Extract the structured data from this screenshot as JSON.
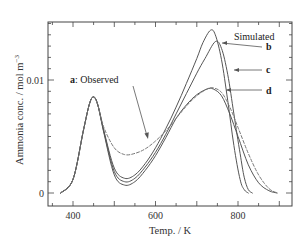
{
  "chart_data": {
    "type": "line",
    "title": "",
    "xlabel": "Temp. / K",
    "ylabel": "Ammonia conc. / mol m⁻³",
    "xlim": [
      340,
      932
    ],
    "ylim": [
      0,
      0.0151
    ],
    "x_ticks": [
      400,
      600,
      800
    ],
    "y_ticks": [
      0,
      0.01
    ],
    "x_tick_labels": [
      "400",
      "600",
      "800"
    ],
    "y_tick_labels": [
      "0",
      "0.01"
    ],
    "grid": false,
    "legend": "none (inline annotations)",
    "series": [
      {
        "name": "a: Observed",
        "style": "dashed",
        "x": [
          370,
          400,
          425,
          440,
          450,
          460,
          475,
          500,
          525,
          550,
          575,
          600,
          625,
          650,
          675,
          700,
          725,
          740,
          760,
          780,
          800,
          825,
          850,
          875,
          895
        ],
        "y": [
          0.0,
          0.0012,
          0.0055,
          0.0079,
          0.0085,
          0.0078,
          0.0058,
          0.004,
          0.0034,
          0.0035,
          0.0039,
          0.0046,
          0.0055,
          0.0066,
          0.0077,
          0.0086,
          0.0092,
          0.0093,
          0.0089,
          0.0076,
          0.0058,
          0.0035,
          0.0016,
          0.0004,
          0.0
        ]
      },
      {
        "name": "b (simulated)",
        "style": "solid",
        "x": [
          370,
          400,
          425,
          440,
          450,
          460,
          475,
          500,
          525,
          550,
          575,
          600,
          625,
          650,
          675,
          700,
          715,
          733,
          745,
          760,
          775,
          790,
          805,
          815,
          825
        ],
        "y": [
          0.0,
          0.0012,
          0.0055,
          0.0079,
          0.0085,
          0.0078,
          0.0055,
          0.0022,
          0.0013,
          0.0016,
          0.0026,
          0.004,
          0.0057,
          0.0076,
          0.0097,
          0.0119,
          0.0133,
          0.0144,
          0.014,
          0.0118,
          0.0082,
          0.0042,
          0.0012,
          0.0003,
          0.0
        ]
      },
      {
        "name": "c (simulated)",
        "style": "solid",
        "x": [
          370,
          400,
          425,
          440,
          450,
          460,
          475,
          500,
          525,
          550,
          575,
          600,
          625,
          650,
          675,
          700,
          720,
          745,
          760,
          775,
          790,
          805,
          815,
          825,
          835
        ],
        "y": [
          0.0,
          0.0012,
          0.0055,
          0.0079,
          0.0085,
          0.0078,
          0.0054,
          0.0019,
          0.001,
          0.0013,
          0.0023,
          0.0036,
          0.0052,
          0.007,
          0.0088,
          0.0106,
          0.0119,
          0.0134,
          0.0128,
          0.0105,
          0.007,
          0.0035,
          0.0014,
          0.0003,
          0.0
        ]
      },
      {
        "name": "d (simulated)",
        "style": "solid",
        "x": [
          370,
          400,
          425,
          440,
          450,
          460,
          475,
          500,
          525,
          550,
          575,
          600,
          625,
          650,
          675,
          700,
          725,
          740,
          760,
          780,
          800,
          825,
          850,
          875,
          895
        ],
        "y": [
          0.0,
          0.0012,
          0.0055,
          0.0079,
          0.0085,
          0.0078,
          0.0053,
          0.0016,
          0.0007,
          0.001,
          0.002,
          0.0033,
          0.0049,
          0.0066,
          0.0078,
          0.0087,
          0.0092,
          0.0092,
          0.0086,
          0.007,
          0.005,
          0.0025,
          0.0009,
          0.0002,
          0.0
        ]
      }
    ],
    "annotations": [
      {
        "text": "Simulated",
        "x": 820,
        "y": 0.0146
      },
      {
        "text": "b",
        "x": 870,
        "y": 0.0131,
        "arrow_to": [
          760,
          0.0136
        ]
      },
      {
        "text": "c",
        "x": 870,
        "y": 0.0112,
        "arrow_to": [
          800,
          0.0112
        ]
      },
      {
        "text": "d",
        "x": 870,
        "y": 0.0091,
        "arrow_to": [
          770,
          0.0093
        ]
      },
      {
        "text": "a: Observed",
        "x": 450,
        "y": 0.0096,
        "arrow_to": [
          590,
          0.0049
        ]
      }
    ]
  },
  "labels": {
    "xlabel": "Temp. / K",
    "ylabel_main": "Ammonia conc. / mol m",
    "ylabel_sup": "−3",
    "x400": "400",
    "x600": "600",
    "x800": "800",
    "y0": "0",
    "y001": "0.01",
    "simulated": "Simulated",
    "b": "b",
    "c": "c",
    "d": "d",
    "a_bold": "a",
    "a_rest": ": Observed"
  }
}
